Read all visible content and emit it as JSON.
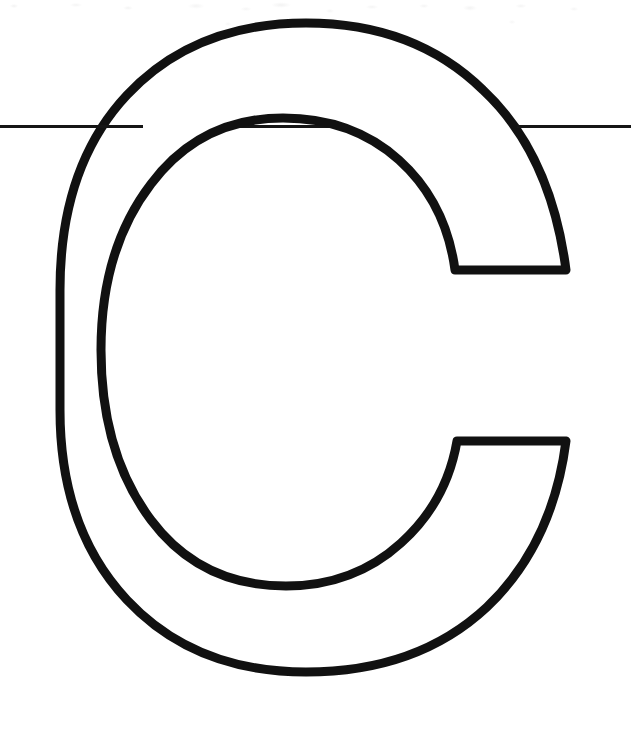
{
  "page": {
    "kind": "worksheet-scan",
    "width": 631,
    "height": 733,
    "background_color": "#FFFFFF",
    "ink_color": "#0D0D0D"
  },
  "artwork": {
    "glyph": "C",
    "glyph_label": "uppercase-letter-c",
    "style": "outline",
    "fill_color": "#FFFFFF",
    "stroke_color": "#111111",
    "stroke_width_px": 9,
    "outer_bounds": {
      "left": 60,
      "top": 55,
      "right": 578,
      "bottom": 672
    },
    "counter_bounds": {
      "left": 179,
      "top": 151,
      "right": 520,
      "bottom": 575
    },
    "upper_terminal_y": 270,
    "lower_terminal_y": 446,
    "terminal_x_start": 450,
    "terminal_x_end": 578
  },
  "rule_line": {
    "label": "horizontal-ruling-line",
    "color": "#151515",
    "thickness_px": 3,
    "y": 126,
    "x_start": 0,
    "x_end": 631,
    "left_segment_end": 143,
    "right_segment_start": 517
  },
  "artifacts": {
    "scan_noise_band_height": 46,
    "noise_color": "#F4F4F4"
  }
}
